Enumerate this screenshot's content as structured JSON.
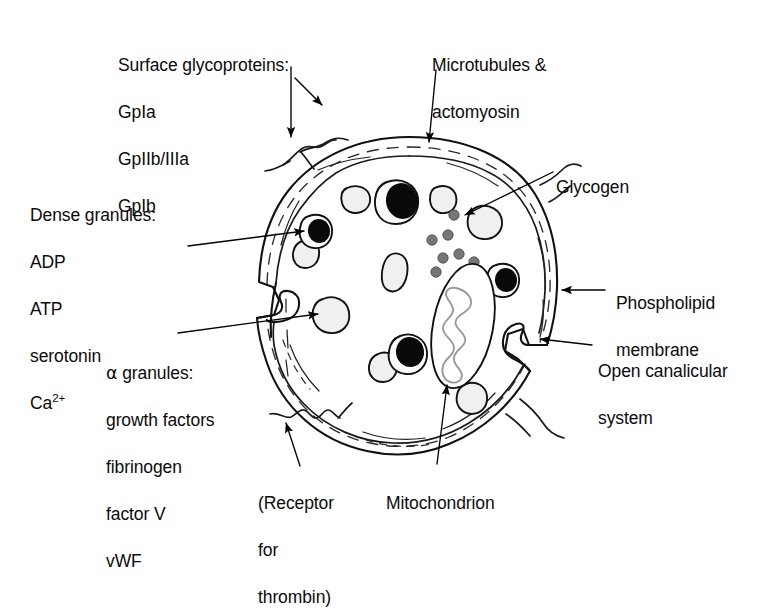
{
  "figure": {
    "background_color": "#ffffff",
    "ink_color": "#111111"
  },
  "labels": {
    "surface_glycoproteins": {
      "title": "Surface glycoproteins:",
      "items": [
        "GpIa",
        "GpIIb/IIIa",
        "GpIb"
      ]
    },
    "dense_granules": {
      "title": "Dense granules:",
      "items": [
        "ADP",
        "ATP",
        "serotonin"
      ],
      "calcium_base": "Ca",
      "calcium_sup": "2+"
    },
    "alpha_granules": {
      "greek": "α",
      "title": " granules:",
      "items": [
        "growth factors",
        "fibrinogen",
        "factor V",
        "vWF"
      ]
    },
    "microtubules": {
      "line1": "Microtubules &",
      "line2": "actomyosin"
    },
    "glycogen": {
      "text": "Glycogen"
    },
    "phospholipid_membrane": {
      "line1": "Phospholipid",
      "line2": "membrane"
    },
    "open_canalicular_system": {
      "line1": "Open canalicular",
      "line2": "system"
    },
    "receptor_for_thrombin": {
      "line1": "(Receptor",
      "line2": "for",
      "line3": "thrombin)"
    },
    "mitochondrion": {
      "text": "Mitochondrion"
    }
  },
  "colors": {
    "alpha_granule_fill": "#f0f0f0",
    "dense_core_fill": "#0a0a0a",
    "glycogen_fill": "#767676",
    "mitochondrion_crista": "#9a9a9a",
    "outline": "#111111"
  },
  "counts": {
    "alpha_granules": 8,
    "dense_granules": 4,
    "glycogen_particles": 8,
    "mitochondria": 1,
    "canalicular_invaginations": 2
  }
}
